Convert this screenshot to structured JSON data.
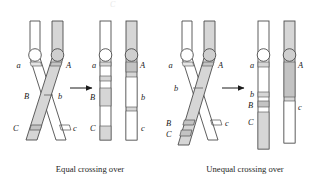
{
  "figure": {
    "title_artifact": "C",
    "background_color": "#ffffff",
    "outline_color": "#4d4d4d",
    "shade_color": "#d6d6d6",
    "band_color": "#c9c9c9",
    "text_color": "#1a1a1a"
  },
  "panels": [
    {
      "id": "equal",
      "caption": "Equal crossing over",
      "arrow": "right-arrow",
      "before": {
        "chromatid_left": {
          "fill": "white",
          "labels": [
            "a",
            "B",
            "C"
          ]
        },
        "chromatid_right": {
          "fill": "shaded",
          "labels": [
            "A",
            "b",
            "c"
          ]
        },
        "crossover_level": "between B and b"
      },
      "after": {
        "chromatid_left": {
          "fill": "mixed",
          "labels": [
            "a",
            "B",
            "C"
          ]
        },
        "chromatid_right": {
          "fill": "mixed",
          "labels": [
            "A",
            "b",
            "c"
          ]
        }
      }
    },
    {
      "id": "unequal",
      "caption": "Unequal crossing over",
      "arrow": "right-arrow",
      "before": {
        "chromatid_left": {
          "fill": "white",
          "labels": [
            "a",
            "B",
            "C"
          ]
        },
        "chromatid_right": {
          "fill": "shaded",
          "labels": [
            "A",
            "b",
            "c"
          ]
        },
        "crossover_level": "misaligned, above b"
      },
      "after": {
        "chromatid_left": {
          "fill": "mixed",
          "labels": [
            "a",
            "b",
            "B",
            "C"
          ],
          "note": "duplication"
        },
        "chromatid_right": {
          "fill": "mixed",
          "labels": [
            "A",
            "c"
          ],
          "note": "deletion"
        }
      }
    }
  ],
  "labels": {
    "a": "a",
    "A": "A",
    "b": "b",
    "B": "B",
    "c": "c",
    "C": "C"
  }
}
